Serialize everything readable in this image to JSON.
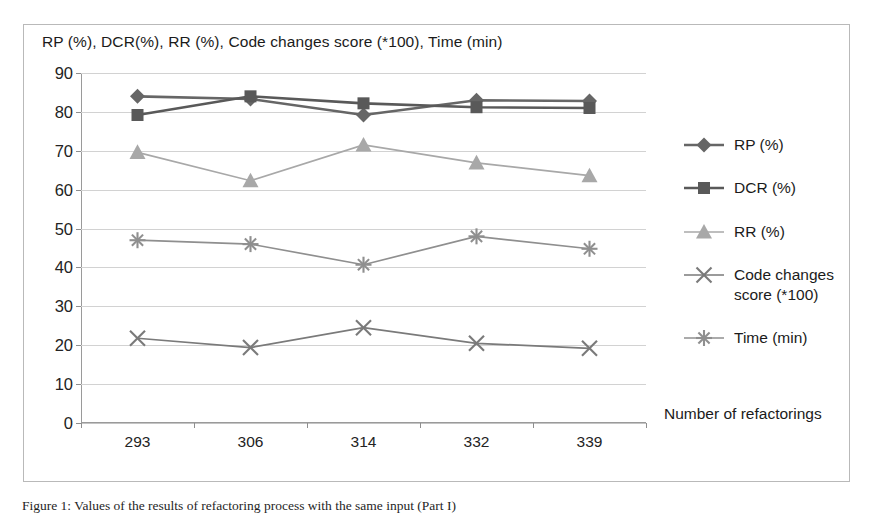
{
  "chart_data": {
    "type": "line",
    "title": "RP (%), DCR(%), RR (%), Code changes score (*100), Time (min)",
    "xlabel": "Number of refactorings",
    "ylabel": "",
    "categories": [
      "293",
      "306",
      "314",
      "332",
      "339"
    ],
    "ylim": [
      0,
      90
    ],
    "ytick_labels": [
      "0",
      "10",
      "20",
      "30",
      "40",
      "50",
      "60",
      "70",
      "80",
      "90"
    ],
    "ytick_values": [
      0,
      10,
      20,
      30,
      40,
      50,
      60,
      70,
      80,
      90
    ],
    "grid": true,
    "legend_position": "right",
    "series": [
      {
        "name": "RP (%)",
        "values": [
          84.0,
          83.3,
          79.2,
          83.0,
          82.8
        ],
        "color": "#666666",
        "marker": "diamond"
      },
      {
        "name": "DCR (%)",
        "values": [
          79.2,
          84.0,
          82.2,
          81.2,
          81.0
        ],
        "color": "#595959",
        "marker": "square"
      },
      {
        "name": "RR (%)",
        "values": [
          69.6,
          62.3,
          71.5,
          66.9,
          63.6
        ],
        "color": "#a8a8a8",
        "marker": "triangle"
      },
      {
        "name": "Code changes score (*100)",
        "values": [
          21.8,
          19.4,
          24.5,
          20.5,
          19.2
        ],
        "color": "#7a7a7a",
        "marker": "cross"
      },
      {
        "name": "Time (min)",
        "values": [
          47.0,
          46.0,
          40.7,
          48.0,
          44.8
        ],
        "color": "#8f8f8f",
        "marker": "star"
      }
    ]
  },
  "legend": {
    "entries": [
      {
        "label": "RP (%)",
        "label_line2": ""
      },
      {
        "label": "DCR (%)",
        "label_line2": ""
      },
      {
        "label": "RR (%)",
        "label_line2": ""
      },
      {
        "label": "Code changes",
        "label_line2": "score (*100)"
      },
      {
        "label": "Time (min)",
        "label_line2": ""
      }
    ]
  },
  "caption": {
    "text": "Figure 1: Values of the results of refactoring process with the same input (Part I)"
  },
  "colors": {
    "frame": "#b9b9b9",
    "grid": "#d2d2d2",
    "axis": "#9a9a9a",
    "text": "#1b1b1b"
  }
}
